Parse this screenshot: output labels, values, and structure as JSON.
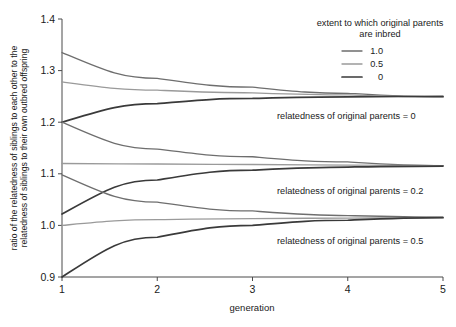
{
  "chart_data": {
    "type": "line",
    "title": "",
    "xlabel": "generation",
    "ylabel": "ratio of the relatedness of siblings to each other to the relatedness of siblings to their own outbred offspring",
    "ylabel_line1": "ratio of the relatedness of siblings to each other to the",
    "ylabel_line2": "relatedness of siblings to their own outbred offspring",
    "x": [
      1,
      2,
      3,
      4,
      5
    ],
    "xlim": [
      1,
      5
    ],
    "ylim": [
      0.9,
      1.4
    ],
    "xticks": [
      "1",
      "2",
      "3",
      "4",
      "5"
    ],
    "yticks": [
      "0.9",
      "1.0",
      "1.1",
      "1.2",
      "1.3",
      "1.4"
    ],
    "ytick_values": [
      0.9,
      1.0,
      1.1,
      1.2,
      1.3,
      1.4
    ],
    "grid": false,
    "legend": {
      "title_line1": "extent to which original parents",
      "title_line2": "are inbred",
      "position": "top-right",
      "entries": [
        {
          "label": "1.0",
          "color": "#6e6e6e",
          "width": 1.3
        },
        {
          "label": "0.5",
          "color": "#9a9a9a",
          "width": 1.3
        },
        {
          "label": "0",
          "color": "#3a3a3a",
          "width": 1.7
        }
      ]
    },
    "annotations": [
      {
        "text": "relatedness of original parents = 0",
        "x_px": 277,
        "y_px": 119
      },
      {
        "text": "relatedness of original parents = 0.2",
        "x_px": 277,
        "y_px": 194
      },
      {
        "text": "relatedness of original parents = 0.5",
        "x_px": 277,
        "y_px": 244
      }
    ],
    "groups": [
      {
        "name": "relatedness of original parents = 0",
        "converges_to": 1.25,
        "series": [
          {
            "name": "inbred 1.0",
            "color": "#6e6e6e",
            "width": 1.3,
            "values": [
              1.335,
              1.285,
              1.268,
              1.256,
              1.249
            ]
          },
          {
            "name": "inbred 0.5",
            "color": "#9a9a9a",
            "width": 1.3,
            "values": [
              1.278,
              1.262,
              1.257,
              1.253,
              1.249
            ]
          },
          {
            "name": "inbred 0",
            "color": "#3a3a3a",
            "width": 1.7,
            "values": [
              1.2,
              1.236,
              1.246,
              1.249,
              1.25
            ]
          }
        ]
      },
      {
        "name": "relatedness of original parents = 0.2",
        "converges_to": 1.115,
        "series": [
          {
            "name": "inbred 1.0",
            "color": "#6e6e6e",
            "width": 1.3,
            "values": [
              1.2,
              1.148,
              1.133,
              1.123,
              1.116
            ]
          },
          {
            "name": "inbred 0.5",
            "color": "#9a9a9a",
            "width": 1.3,
            "values": [
              1.12,
              1.119,
              1.118,
              1.117,
              1.116
            ]
          },
          {
            "name": "inbred 0",
            "color": "#3a3a3a",
            "width": 1.7,
            "values": [
              1.022,
              1.088,
              1.107,
              1.113,
              1.115
            ]
          }
        ]
      },
      {
        "name": "relatedness of original parents = 0.5",
        "converges_to": 1.015,
        "series": [
          {
            "name": "inbred 1.0",
            "color": "#6e6e6e",
            "width": 1.3,
            "values": [
              1.098,
              1.045,
              1.028,
              1.019,
              1.016
            ]
          },
          {
            "name": "inbred 0.5",
            "color": "#9a9a9a",
            "width": 1.3,
            "values": [
              1.0,
              1.011,
              1.013,
              1.014,
              1.015
            ]
          },
          {
            "name": "inbred 0",
            "color": "#3a3a3a",
            "width": 1.7,
            "values": [
              0.9,
              0.977,
              1.0,
              1.01,
              1.015
            ]
          }
        ]
      }
    ],
    "plot_box": {
      "left": 62,
      "right": 443,
      "top": 19,
      "bottom": 277
    },
    "colors": {
      "axis": "#4a4a4a",
      "text": "#1a1a1a",
      "background": "#ffffff"
    }
  }
}
